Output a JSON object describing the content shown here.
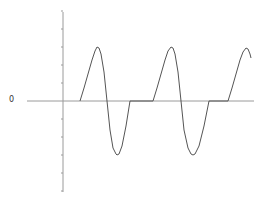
{
  "chart_data": {
    "type": "line",
    "title": "",
    "xlabel": "",
    "ylabel": "",
    "y_tick_labels": [
      "0"
    ],
    "grid": false,
    "legend": null,
    "ylim": [
      -5,
      5
    ],
    "axis_pixels": {
      "y_axis_x": 63,
      "y_axis_top": 12,
      "y_axis_bottom": 192,
      "zero_y": 101,
      "zero_line_x_start": 27,
      "zero_line_x_end": 254,
      "tick_spacing": 18,
      "tick_count_above": 5,
      "tick_count_below": 5
    },
    "series": [
      {
        "name": "waveform",
        "color": "#555555",
        "description": "Periodic sinusoidal pulses separated by flat zero segments",
        "points_px": [
          [
            80,
            101
          ],
          [
            84,
            88
          ],
          [
            88,
            74
          ],
          [
            92,
            60
          ],
          [
            95,
            51
          ],
          [
            97,
            47
          ],
          [
            99,
            48
          ],
          [
            101,
            54
          ],
          [
            104,
            72
          ],
          [
            107,
            101
          ],
          [
            110,
            130
          ],
          [
            113,
            148
          ],
          [
            116,
            154
          ],
          [
            117,
            155
          ],
          [
            119,
            154
          ],
          [
            122,
            146
          ],
          [
            126,
            126
          ],
          [
            130,
            101
          ],
          [
            153,
            101
          ],
          [
            157,
            88
          ],
          [
            161,
            74
          ],
          [
            165,
            60
          ],
          [
            168,
            51
          ],
          [
            171,
            47
          ],
          [
            173,
            48
          ],
          [
            175,
            54
          ],
          [
            178,
            72
          ],
          [
            181,
            101
          ],
          [
            184,
            130
          ],
          [
            188,
            148
          ],
          [
            191,
            154
          ],
          [
            193,
            155
          ],
          [
            195,
            154
          ],
          [
            199,
            146
          ],
          [
            204,
            126
          ],
          [
            209,
            101
          ],
          [
            228,
            101
          ],
          [
            232,
            88
          ],
          [
            236,
            74
          ],
          [
            240,
            60
          ],
          [
            243,
            52
          ],
          [
            246,
            48
          ],
          [
            248,
            49
          ],
          [
            250,
            54
          ],
          [
            251,
            58
          ]
        ],
        "values_approx": {
          "peak": 3,
          "trough": -3,
          "baseline": 0
        }
      }
    ]
  },
  "labels": {
    "zero": "0"
  }
}
